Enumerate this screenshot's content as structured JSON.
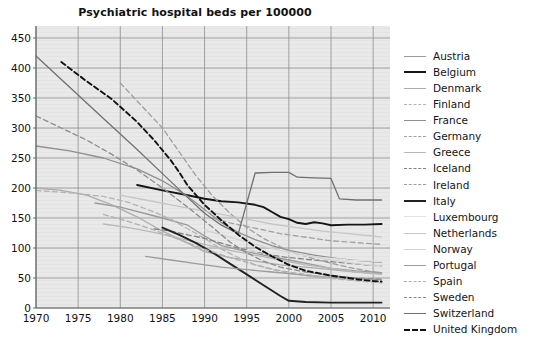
{
  "chart_data": {
    "type": "line",
    "title": "Psychiatric hospital beds per 100000",
    "xlabel": "",
    "ylabel": "",
    "xlim": [
      1970,
      2012
    ],
    "ylim": [
      0,
      470
    ],
    "yticks": [
      0,
      50,
      100,
      150,
      200,
      250,
      300,
      350,
      400,
      450
    ],
    "xticks": [
      1970,
      1975,
      1980,
      1985,
      1990,
      1995,
      2000,
      2005,
      2010
    ],
    "grid": true,
    "legend_position": "right",
    "series": [
      {
        "name": "Austria",
        "color": "#9a9a9a",
        "dash": "solid",
        "points": [
          [
            1977,
            175
          ],
          [
            1980,
            168
          ],
          [
            1985,
            150
          ],
          [
            1988,
            138
          ],
          [
            1990,
            120
          ],
          [
            1992,
            104
          ],
          [
            1995,
            94
          ],
          [
            1997,
            88
          ],
          [
            2000,
            80
          ],
          [
            2003,
            72
          ],
          [
            2005,
            66
          ],
          [
            2008,
            62
          ],
          [
            2010,
            60
          ],
          [
            2011,
            59
          ]
        ]
      },
      {
        "name": "Belgium",
        "color": "#151515",
        "dash": "solid",
        "points": [
          [
            1982,
            205
          ],
          [
            1985,
            196
          ],
          [
            1988,
            188
          ],
          [
            1990,
            182
          ],
          [
            1992,
            178
          ],
          [
            1994,
            176
          ],
          [
            1996,
            172
          ],
          [
            1997,
            168
          ],
          [
            1998,
            160
          ],
          [
            1999,
            152
          ],
          [
            2000,
            148
          ],
          [
            2001,
            142
          ],
          [
            2002,
            140
          ],
          [
            2003,
            143
          ],
          [
            2004,
            141
          ],
          [
            2005,
            138
          ],
          [
            2007,
            139
          ],
          [
            2009,
            139
          ],
          [
            2011,
            140
          ]
        ]
      },
      {
        "name": "Denmark",
        "color": "#acacac",
        "dash": "solid",
        "points": [
          [
            1970,
            200
          ],
          [
            1973,
            196
          ],
          [
            1976,
            188
          ],
          [
            1979,
            172
          ],
          [
            1982,
            152
          ],
          [
            1985,
            128
          ],
          [
            1988,
            108
          ],
          [
            1990,
            94
          ],
          [
            1993,
            84
          ],
          [
            1996,
            78
          ],
          [
            1999,
            72
          ],
          [
            2002,
            68
          ],
          [
            2005,
            64
          ],
          [
            2008,
            60
          ],
          [
            2011,
            57
          ]
        ]
      },
      {
        "name": "Finland",
        "color": "#b4b4b4",
        "dash": "dashed",
        "points": [
          [
            1970,
            196
          ],
          [
            1974,
            192
          ],
          [
            1978,
            186
          ],
          [
            1981,
            176
          ],
          [
            1984,
            160
          ],
          [
            1986,
            148
          ],
          [
            1988,
            132
          ],
          [
            1990,
            116
          ],
          [
            1992,
            98
          ],
          [
            1994,
            84
          ],
          [
            1996,
            72
          ],
          [
            1998,
            64
          ],
          [
            2000,
            58
          ],
          [
            2003,
            52
          ],
          [
            2006,
            48
          ],
          [
            2009,
            44
          ],
          [
            2011,
            42
          ]
        ]
      },
      {
        "name": "France",
        "color": "#8f8f8f",
        "dash": "solid",
        "points": [
          [
            1970,
            270
          ],
          [
            1974,
            262
          ],
          [
            1978,
            250
          ],
          [
            1982,
            232
          ],
          [
            1985,
            212
          ],
          [
            1988,
            186
          ],
          [
            1990,
            164
          ],
          [
            1992,
            142
          ],
          [
            1994,
            126
          ],
          [
            1996,
            114
          ],
          [
            1998,
            104
          ],
          [
            2000,
            96
          ],
          [
            2003,
            88
          ],
          [
            2006,
            82
          ],
          [
            2009,
            78
          ],
          [
            2011,
            76
          ]
        ]
      },
      {
        "name": "Germany",
        "color": "#a2a2a2",
        "dash": "dashed",
        "points": [
          [
            1991,
            150
          ],
          [
            1993,
            142
          ],
          [
            1995,
            136
          ],
          [
            1997,
            130
          ],
          [
            1999,
            124
          ],
          [
            2001,
            120
          ],
          [
            2003,
            116
          ],
          [
            2005,
            112
          ],
          [
            2007,
            110
          ],
          [
            2009,
            108
          ],
          [
            2011,
            106
          ]
        ]
      },
      {
        "name": "Greece",
        "color": "#b8b8b8",
        "dash": "solid",
        "points": [
          [
            1978,
            140
          ],
          [
            1981,
            134
          ],
          [
            1984,
            126
          ],
          [
            1987,
            116
          ],
          [
            1990,
            106
          ],
          [
            1993,
            96
          ],
          [
            1996,
            88
          ],
          [
            1999,
            80
          ],
          [
            2002,
            72
          ],
          [
            2005,
            66
          ],
          [
            2008,
            60
          ],
          [
            2011,
            56
          ]
        ]
      },
      {
        "name": "Iceland",
        "color": "#848484",
        "dash": "dashed",
        "points": [
          [
            1984,
            132
          ],
          [
            1986,
            128
          ],
          [
            1988,
            122
          ],
          [
            1990,
            116
          ],
          [
            1992,
            108
          ],
          [
            1994,
            100
          ],
          [
            1996,
            94
          ],
          [
            1998,
            88
          ],
          [
            2000,
            84
          ],
          [
            2003,
            80
          ],
          [
            2006,
            76
          ],
          [
            2009,
            72
          ],
          [
            2011,
            70
          ]
        ]
      },
      {
        "name": "Ireland",
        "color": "#9e9e9e",
        "dash": "dashed",
        "points": [
          [
            1980,
            375
          ],
          [
            1983,
            330
          ],
          [
            1985,
            300
          ],
          [
            1987,
            260
          ],
          [
            1989,
            220
          ],
          [
            1991,
            186
          ],
          [
            1993,
            158
          ],
          [
            1995,
            134
          ],
          [
            1997,
            116
          ],
          [
            1999,
            102
          ],
          [
            2001,
            90
          ],
          [
            2004,
            78
          ],
          [
            2007,
            68
          ],
          [
            2010,
            60
          ],
          [
            2011,
            58
          ]
        ]
      },
      {
        "name": "Italy",
        "color": "#222222",
        "dash": "solid",
        "points": [
          [
            1985,
            134
          ],
          [
            1987,
            122
          ],
          [
            1989,
            108
          ],
          [
            1991,
            92
          ],
          [
            1993,
            74
          ],
          [
            1995,
            56
          ],
          [
            1997,
            38
          ],
          [
            1999,
            20
          ],
          [
            2000,
            12
          ],
          [
            2002,
            10
          ],
          [
            2005,
            9
          ],
          [
            2008,
            9
          ],
          [
            2011,
            9
          ]
        ]
      },
      {
        "name": "Luxembourg",
        "color": "#e2e2e2",
        "dash": "solid",
        "points": [
          [
            1995,
            96
          ],
          [
            1998,
            92
          ],
          [
            2001,
            88
          ],
          [
            2004,
            84
          ],
          [
            2007,
            80
          ],
          [
            2010,
            78
          ],
          [
            2011,
            77
          ]
        ]
      },
      {
        "name": "Netherlands",
        "color": "#c6c6c6",
        "dash": "solid",
        "points": [
          [
            1980,
            188
          ],
          [
            1983,
            180
          ],
          [
            1986,
            172
          ],
          [
            1989,
            164
          ],
          [
            1992,
            156
          ],
          [
            1995,
            148
          ],
          [
            1998,
            140
          ],
          [
            2001,
            134
          ],
          [
            2004,
            128
          ],
          [
            2007,
            124
          ],
          [
            2010,
            120
          ],
          [
            2011,
            118
          ]
        ]
      },
      {
        "name": "Norway",
        "color": "#d4d4d4",
        "dash": "solid",
        "points": [
          [
            1990,
            130
          ],
          [
            1993,
            118
          ],
          [
            1996,
            106
          ],
          [
            1999,
            96
          ],
          [
            2002,
            88
          ],
          [
            2005,
            80
          ],
          [
            2008,
            74
          ],
          [
            2011,
            70
          ]
        ]
      },
      {
        "name": "Portugal",
        "color": "#9c9c9c",
        "dash": "solid",
        "points": [
          [
            1983,
            86
          ],
          [
            1986,
            80
          ],
          [
            1989,
            74
          ],
          [
            1992,
            68
          ],
          [
            1995,
            64
          ],
          [
            1998,
            60
          ],
          [
            2001,
            56
          ],
          [
            2004,
            52
          ],
          [
            2007,
            50
          ],
          [
            2010,
            48
          ],
          [
            2011,
            47
          ]
        ]
      },
      {
        "name": "Spain",
        "color": "#b0b0b0",
        "dash": "dashed",
        "points": [
          [
            1978,
            156
          ],
          [
            1981,
            144
          ],
          [
            1984,
            130
          ],
          [
            1987,
            114
          ],
          [
            1990,
            98
          ],
          [
            1993,
            84
          ],
          [
            1996,
            72
          ],
          [
            1999,
            62
          ],
          [
            2002,
            56
          ],
          [
            2005,
            50
          ],
          [
            2008,
            46
          ],
          [
            2011,
            44
          ]
        ]
      },
      {
        "name": "Sweden",
        "color": "#8c8c8c",
        "dash": "dashed",
        "points": [
          [
            1970,
            320
          ],
          [
            1973,
            300
          ],
          [
            1976,
            280
          ],
          [
            1979,
            256
          ],
          [
            1982,
            230
          ],
          [
            1985,
            200
          ],
          [
            1988,
            168
          ],
          [
            1991,
            134
          ],
          [
            1993,
            110
          ],
          [
            1995,
            92
          ],
          [
            1997,
            78
          ],
          [
            1999,
            68
          ],
          [
            2002,
            60
          ],
          [
            2005,
            54
          ],
          [
            2008,
            50
          ],
          [
            2011,
            48
          ]
        ]
      },
      {
        "name": "Switzerland",
        "color": "#707070",
        "dash": "solid",
        "points": [
          [
            1970,
            420
          ],
          [
            1974,
            368
          ],
          [
            1978,
            316
          ],
          [
            1982,
            264
          ],
          [
            1985,
            224
          ],
          [
            1988,
            184
          ],
          [
            1990,
            158
          ],
          [
            1992,
            138
          ],
          [
            1994,
            124
          ],
          [
            1996,
            225
          ],
          [
            1998,
            226
          ],
          [
            2000,
            226
          ],
          [
            2001,
            218
          ],
          [
            2003,
            217
          ],
          [
            2005,
            216
          ],
          [
            2006,
            182
          ],
          [
            2008,
            180
          ],
          [
            2010,
            180
          ],
          [
            2011,
            180
          ]
        ]
      },
      {
        "name": "United Kingdom",
        "color": "#121212",
        "dash": "dashed",
        "points": [
          [
            1973,
            410
          ],
          [
            1976,
            378
          ],
          [
            1979,
            348
          ],
          [
            1982,
            310
          ],
          [
            1984,
            280
          ],
          [
            1986,
            246
          ],
          [
            1987,
            226
          ],
          [
            1988,
            204
          ],
          [
            1990,
            172
          ],
          [
            1992,
            146
          ],
          [
            1994,
            122
          ],
          [
            1996,
            102
          ],
          [
            1998,
            86
          ],
          [
            2000,
            72
          ],
          [
            2002,
            62
          ],
          [
            2005,
            54
          ],
          [
            2008,
            48
          ],
          [
            2010,
            45
          ],
          [
            2011,
            44
          ]
        ]
      }
    ]
  },
  "legend": {
    "items": [
      {
        "label": "Austria"
      },
      {
        "label": "Belgium"
      },
      {
        "label": "Denmark"
      },
      {
        "label": "Finland"
      },
      {
        "label": "France"
      },
      {
        "label": "Germany"
      },
      {
        "label": "Greece"
      },
      {
        "label": "Iceland"
      },
      {
        "label": "Ireland"
      },
      {
        "label": "Italy"
      },
      {
        "label": "Luxembourg"
      },
      {
        "label": "Netherlands"
      },
      {
        "label": "Norway"
      },
      {
        "label": "Portugal"
      },
      {
        "label": "Spain"
      },
      {
        "label": "Sweden"
      },
      {
        "label": "Switzerland"
      },
      {
        "label": "United Kingdom"
      }
    ]
  },
  "style": {
    "plot_background": "#e8e8e8",
    "grid_color": "#8d8d8d",
    "text_color": "#111111"
  }
}
